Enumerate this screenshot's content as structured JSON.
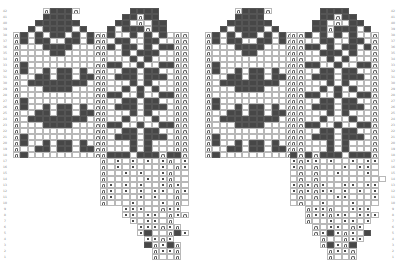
{
  "chart": {
    "title": "",
    "type": "knitting-colorwork-chart",
    "rows_total": 42,
    "cell_w": 7.4,
    "cell_h": 6.0,
    "legend": {
      "dark": "contrast colour stitch",
      "dot": "purl / dot stitch",
      "arch": "edge / seam stitch (arch symbol)",
      "blank": "main colour stitch"
    },
    "colors": {
      "dark": "#474747",
      "grid": "#b8b8b8",
      "background": "#ffffff"
    }
  },
  "row_labels_left": {
    "x": 0,
    "from": 1,
    "to": 42
  },
  "row_labels_right": {
    "x": 388,
    "from": 1,
    "to": 42
  },
  "pieces": [
    {
      "name": "left-mitten-back",
      "x": 13,
      "top_row": 42,
      "cols": 12,
      "rows": [
        "....aDDDa...",
        "....DDDD....",
        "...DDDDDD...",
        "..D.DDDD.D..",
        "aD.D.DD.D.Da",
        "aD.DD..DD.Da",
        "a...DDDD...a",
        "a....DD....a",
        "a...........",
        "aD.........a",
        "aD..D.DD.D.a",
        "a..DD.DD.DDa",
        "a.DDDDDDDD.a",
        "a...DDDD...a",
        "a..........a",
        "aD.........a",
        "aD..D.DD.D.a",
        "a..DD.DD.DDa",
        "a.DDDDDDDD.a",
        "a...DDDD...a",
        "a..........a",
        "aD.........a",
        "aD..D.DD.D.a",
        "a..DD.DD.DDa",
        "aD.........a"
      ]
    },
    {
      "name": "left-mitten-palm",
      "x": 100,
      "top_row": 42,
      "cols": 12,
      "rows": [
        "....DDDD....",
        "...DDaDD....",
        "..DD.a.DD...",
        ".D.DDDaDD...",
        "aD..D.D.D.aa",
        "a.DD..DD..aa",
        "aD.DD.D.DDaa",
        "a..D.DDD..aa",
        "a...D.D...aa",
        "aDD..D..DDaa",
        "a..DD.DD..aa",
        "a.DDD.DDD.aa",
        "a...D.D...aa",
        "a..D.D.D..aa",
        "aDD..D..DDaa",
        "a..DD.DD..aa",
        "a.DDD.DDD.aa",
        "a...D.D...aa",
        "a..D...D..aa",
        "aDD..D..DDaa",
        "a..DD.DD..aa",
        "a.DDD.DDD.aa",
        "a...D.D...aa",
        "a...D.D...aa",
        "aDDD.DDDaDDa",
        "a.o.o.o.oa.o",
        "a.o.o...o.ao",
        "a..o.o..oa..",
        "a.....o.oa..",
        "ao.o.o..oao.",
        "ao.o.o.oo.ao",
        "ao...o.o..a.",
        "a...o...o.a.",
        "...ooo..aoo.",
        "...oo.oo.aoa",
        "....o.oo.a..",
        ".....oooaoa.",
        ".....oD..aDo",
        "......ooao..",
        "......DaoDa.",
        ".......aooa.",
        ".......a..a."
      ]
    },
    {
      "name": "right-mitten-back",
      "x": 205,
      "top_row": 42,
      "cols": 12,
      "rows": [
        "....aDDDa...",
        "....DDDD....",
        "...DDDDDD...",
        "..D.DDDD.D..",
        "aD.D.DD.D.Da",
        "aD.DD..DD.Da",
        "a...DDDD...a",
        "a....DD....a",
        "a...........",
        "aD.........a",
        "aD..D.DD.D.a",
        "a..DD.DD.DDa",
        "a.DDDDDDDD.a",
        "a...DDDD...a",
        "a..........a",
        "aD.........a",
        "aD..D.DD.D.a",
        "a..DD.DD.DDa",
        "a.DDDDDDDD.a",
        "a...DDDD...a",
        "a..........a",
        "aD.........a",
        "aD..D.DD.D.a",
        "a..DD.DD.DDa",
        "aD.........a"
      ]
    },
    {
      "name": "right-mitten-palm",
      "x": 290,
      "top_row": 42,
      "cols": 12,
      "rows": [
        "....DDDD....",
        "....DDaDD...",
        "...DD.a.DD..",
        "...DDaDDD.D.",
        "aaD.D.D.D..a",
        "aa..DD..DD.a",
        "aaDD.D.DD.Da",
        "aa..DDD.D..a",
        "aa...D.D...a",
        "aaDD..D..DDa",
        "aa..DD.DD..a",
        "aa.DDD.DDD.a",
        "aa...D.D...a",
        "aa..D.D.D..a",
        "aaDD..D..DDa",
        "aa..DD.DD..a",
        "aa.DDD.DDD.a",
        "aa...D.D...a",
        "aa..D...D..a",
        "aaDD..D..DDa",
        "aa..DD.DD..a",
        "aa.DDD.DDD.a",
        "aa...D.D...a",
        "aa...D.D...a",
        "DaDaDDD.DDDa",
        "oaoo.o..o.oo",
        "oa.a...o.oo.",
        ".a.a..o...o.",
        ".a.a.........",
        "oaoao..oo.oo",
        "oaoaoo.o.o.o",
        ".a.a..oo...o",
        ".a..o...o...",
        "..aooa..ooo.",
        "..aooaoo.ooo",
        "..a..o.oo.o.",
        "...a.oo.ao..",
        "...aoDoao.D.",
        "....a..aoo..",
        "....aDoaD...",
        ".....aooa...",
        ".....a..a..."
      ]
    }
  ]
}
